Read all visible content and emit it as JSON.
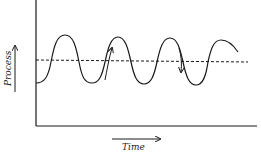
{
  "diagram": {
    "type": "process-over-time",
    "y_axis_label": "Process",
    "x_axis_label": "Time",
    "series": {
      "name": "process-oscillation",
      "shape": "sine",
      "cycles_visible": 3.5,
      "mean_line": "dashed"
    },
    "annotations": [
      {
        "type": "arrow",
        "direction": "up",
        "position": "rising crossing, cycle 2"
      },
      {
        "type": "arrow",
        "direction": "down",
        "position": "falling crossing, cycle 3"
      }
    ],
    "colors": {
      "line": "#1a1a1a",
      "background": "#ffffff"
    }
  }
}
